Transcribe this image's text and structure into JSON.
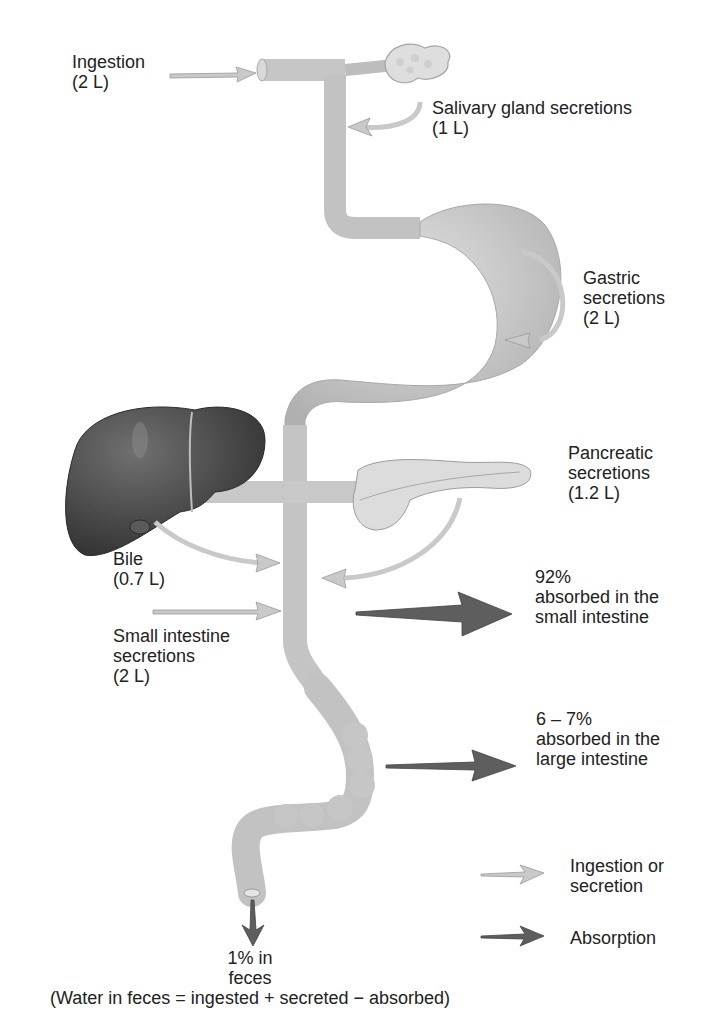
{
  "figure": {
    "colors": {
      "tube": "#c8c8c8",
      "tube_edge": "#a8a8a8",
      "liver": "#4a4a4a",
      "secretion_arrow": "#c9c9c9",
      "absorption_arrow": "#5e5e5e",
      "text": "#222222"
    }
  },
  "labels": {
    "ingestion": {
      "line1": "Ingestion",
      "line2": "(2 L)"
    },
    "salivary": {
      "line1": "Salivary gland secretions",
      "line2": "(1 L)"
    },
    "gastric": {
      "line1": "Gastric",
      "line2": "secretions",
      "line3": "(2 L)"
    },
    "pancreatic": {
      "line1": "Pancreatic",
      "line2": "secretions",
      "line3": "(1.2 L)"
    },
    "bile": {
      "line1": "Bile",
      "line2": "(0.7 L)"
    },
    "small_intestine_secretions": {
      "line1": "Small intestine",
      "line2": "secretions",
      "line3": "(2 L)"
    },
    "small_absorption": {
      "line1": "92%",
      "line2": "absorbed in the",
      "line3": "small intestine"
    },
    "large_absorption": {
      "line1": "6 – 7%",
      "line2": "absorbed in the",
      "line3": "large intestine"
    },
    "feces": {
      "line1": "1% in",
      "line2": "feces",
      "line3": "(Water in feces = ingested + secreted − absorbed)"
    }
  },
  "legend": {
    "items": [
      {
        "label_line1": "Ingestion or",
        "label_line2": "secretion",
        "icon": "light-gray-arrow-icon"
      },
      {
        "label_line1": "Absorption",
        "icon": "dark-gray-arrow-icon"
      }
    ]
  },
  "organs": [
    "salivary-gland",
    "esophagus",
    "stomach",
    "liver",
    "gallbladder",
    "pancreas",
    "small-intestine",
    "large-intestine"
  ]
}
